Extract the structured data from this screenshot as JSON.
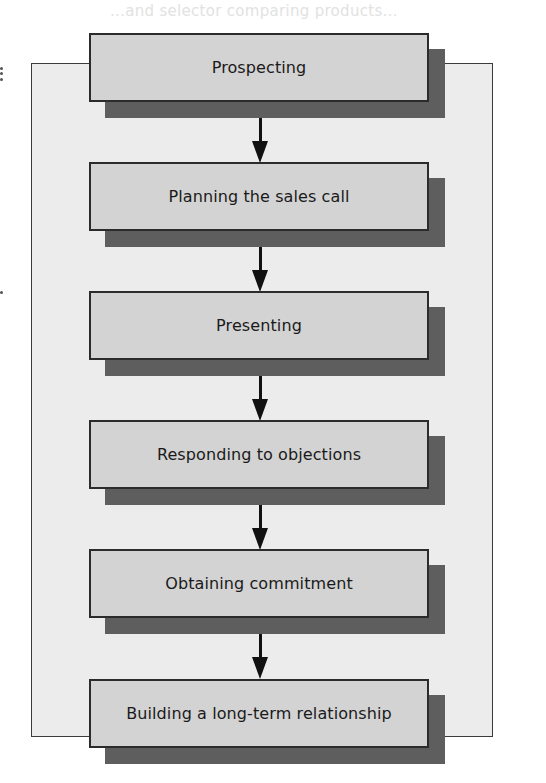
{
  "diagram": {
    "type": "flowchart",
    "direction": "top-to-bottom",
    "faded_header_text": "...and selector comparing products...",
    "steps": [
      {
        "id": 1,
        "label": "Prospecting"
      },
      {
        "id": 2,
        "label": "Planning the sales call"
      },
      {
        "id": 3,
        "label": "Presenting"
      },
      {
        "id": 4,
        "label": "Responding to objections"
      },
      {
        "id": 5,
        "label": "Obtaining commitment"
      },
      {
        "id": 6,
        "label": "Building a long-term relationship"
      }
    ],
    "connections": [
      {
        "from": 1,
        "to": 2
      },
      {
        "from": 2,
        "to": 3
      },
      {
        "from": 3,
        "to": 4
      },
      {
        "from": 4,
        "to": 5
      },
      {
        "from": 5,
        "to": 6
      }
    ],
    "colors": {
      "panel_background": "#ececec",
      "panel_border": "#3a3a3a",
      "box_fill": "#d3d3d3",
      "box_border": "#2b2b2b",
      "box_shadow": "#5e5e5e",
      "arrow": "#111111",
      "text": "#1a1a1a"
    }
  }
}
